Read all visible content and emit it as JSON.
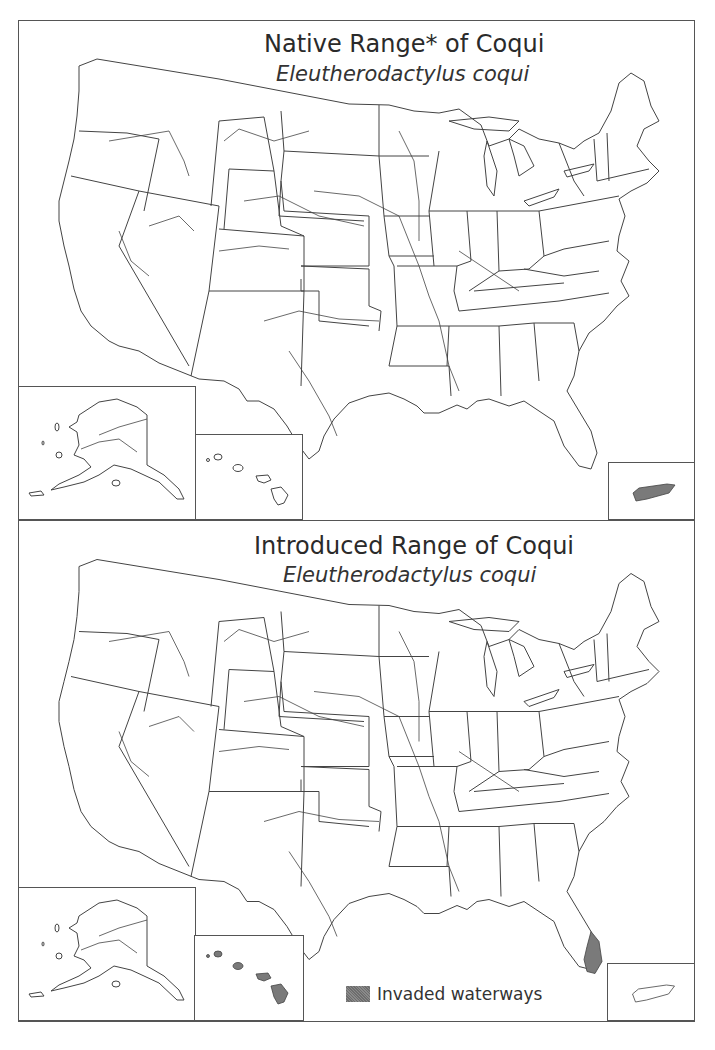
{
  "panels": [
    {
      "id": "native",
      "title": "Native Range* of Coqui",
      "scientific_name": "Eleutherodactylus coqui",
      "shaded_regions": [
        "puerto-rico"
      ]
    },
    {
      "id": "introduced",
      "title": "Introduced Range of Coqui",
      "scientific_name": "Eleutherodactylus coqui",
      "shaded_regions": [
        "hawaii",
        "southeast-florida"
      ],
      "legend": {
        "label": "Invaded waterways",
        "swatch_color": "#7a7a7a"
      }
    }
  ],
  "colors": {
    "outline": "#444444",
    "shade": "#7a7a7a",
    "frame": "#555555",
    "background": "#ffffff"
  },
  "insets": [
    "Alaska",
    "Hawaii",
    "Puerto Rico"
  ]
}
